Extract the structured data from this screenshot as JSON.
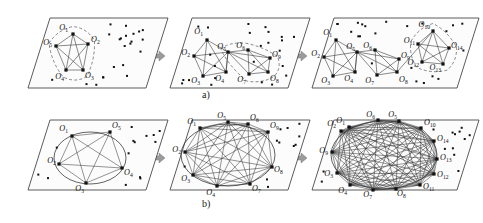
{
  "figure": {
    "type": "diagram",
    "caption_rows": [
      {
        "id": "a",
        "label": "a)",
        "description": "plane-view growth of object cliques with dashed cluster boundaries"
      },
      {
        "id": "b",
        "label": "b)",
        "description": "circular-layout growth of the merged clique graph"
      }
    ],
    "panel_count_per_row": 3,
    "arrow_count_per_row": 2,
    "arrow_color": "#9b9b9b",
    "plane_fill": "#fcfcfc",
    "plane_stroke": "#4a4a4a",
    "node_color": "#111111",
    "edge_color": "#2b2b2b",
    "dashed_boundary_color": "#555555",
    "label_prefix": "O"
  },
  "row_a": {
    "label": "a)",
    "panels": [
      {
        "index": 1,
        "node_labels": [
          "O",
          "O",
          "O",
          "O",
          "O"
        ],
        "node_subscripts": [
          "1",
          "2",
          "3",
          "4",
          "5"
        ],
        "nodes": [
          {
            "label": "O",
            "sub": "1",
            "x": 73,
            "y": 34,
            "lx": 68,
            "ly": 30,
            "anchor": "end"
          },
          {
            "label": "O",
            "sub": "2",
            "x": 88,
            "y": 44,
            "lx": 91,
            "ly": 42,
            "anchor": "start"
          },
          {
            "label": "O",
            "sub": "3",
            "x": 83,
            "y": 70,
            "lx": 85,
            "ly": 78,
            "anchor": "start"
          },
          {
            "label": "O",
            "sub": "4",
            "x": 66,
            "y": 70,
            "lx": 64,
            "ly": 79,
            "anchor": "end"
          },
          {
            "label": "O",
            "sub": "5",
            "x": 56,
            "y": 46,
            "lx": 52,
            "ly": 45,
            "anchor": "end"
          }
        ],
        "clique_edges": "all-pairs",
        "clusters": [
          {
            "members": [
              "O1",
              "O2",
              "O3",
              "O4",
              "O5"
            ],
            "dashed": true
          }
        ],
        "scatter_dot_count": 22
      },
      {
        "index": 2,
        "node_subscripts": [
          "1",
          "2",
          "3",
          "4",
          "5",
          "6",
          "7",
          "8"
        ],
        "nodes": [
          {
            "label": "O",
            "sub": "1",
            "x": 207,
            "y": 40,
            "lx": 203,
            "ly": 34,
            "anchor": "end"
          },
          {
            "label": "O",
            "sub": "2",
            "x": 194,
            "y": 56,
            "lx": 190,
            "ly": 55,
            "anchor": "end"
          },
          {
            "label": "O",
            "sub": "3",
            "x": 203,
            "y": 76,
            "lx": 200,
            "ly": 83,
            "anchor": "end"
          },
          {
            "label": "O",
            "sub": "4",
            "x": 226,
            "y": 72,
            "lx": 224,
            "ly": 81,
            "anchor": "end"
          },
          {
            "label": "O",
            "sub": "5",
            "x": 228,
            "y": 52,
            "lx": 226,
            "ly": 49,
            "anchor": "end"
          },
          {
            "label": "O",
            "sub": "6",
            "x": 248,
            "y": 50,
            "lx": 245,
            "ly": 48,
            "anchor": "end"
          },
          {
            "label": "O",
            "sub": "7",
            "x": 249,
            "y": 74,
            "lx": 246,
            "ly": 82,
            "anchor": "end"
          },
          {
            "label": "O",
            "sub": "8",
            "x": 268,
            "y": 72,
            "lx": 270,
            "ly": 81,
            "anchor": "start"
          },
          {
            "label": "O",
            "sub": "9",
            "x": 270,
            "y": 58,
            "lx": 272,
            "ly": 57,
            "anchor": "start"
          }
        ],
        "clusters": [
          {
            "members": [
              "O1",
              "O2",
              "O3",
              "O4",
              "O5"
            ],
            "dashed": false
          },
          {
            "members": [
              "O5",
              "O6",
              "O7",
              "O8",
              "O9"
            ],
            "dashed": true
          }
        ],
        "scatter_dot_count": 24
      },
      {
        "index": 3,
        "node_subscripts": [
          "1",
          "2",
          "3",
          "4",
          "5",
          "6",
          "7",
          "8",
          "9",
          "10",
          "11",
          "12",
          "13",
          "14"
        ],
        "nodes": [
          {
            "label": "O",
            "sub": "1",
            "x": 336,
            "y": 40,
            "lx": 332,
            "ly": 35,
            "anchor": "end"
          },
          {
            "label": "O",
            "sub": "2",
            "x": 324,
            "y": 57,
            "lx": 320,
            "ly": 56,
            "anchor": "end"
          },
          {
            "label": "O",
            "sub": "3",
            "x": 333,
            "y": 76,
            "lx": 330,
            "ly": 83,
            "anchor": "end"
          },
          {
            "label": "O",
            "sub": "4",
            "x": 355,
            "y": 72,
            "lx": 353,
            "ly": 81,
            "anchor": "end"
          },
          {
            "label": "O",
            "sub": "5",
            "x": 357,
            "y": 52,
            "lx": 355,
            "ly": 49,
            "anchor": "end"
          },
          {
            "label": "O",
            "sub": "6",
            "x": 375,
            "y": 50,
            "lx": 372,
            "ly": 48,
            "anchor": "end"
          },
          {
            "label": "O",
            "sub": "7",
            "x": 377,
            "y": 75,
            "lx": 374,
            "ly": 83,
            "anchor": "end"
          },
          {
            "label": "O",
            "sub": "8",
            "x": 397,
            "y": 72,
            "lx": 399,
            "ly": 82,
            "anchor": "start"
          },
          {
            "label": "O",
            "sub": "9",
            "x": 399,
            "y": 59,
            "lx": 401,
            "ly": 58,
            "anchor": "start"
          },
          {
            "label": "O",
            "sub": "10",
            "x": 433,
            "y": 31,
            "lx": 430,
            "ly": 27,
            "anchor": "end"
          },
          {
            "label": "O",
            "sub": "11",
            "x": 418,
            "y": 44,
            "lx": 415,
            "ly": 43,
            "anchor": "end"
          },
          {
            "label": "O",
            "sub": "12",
            "x": 422,
            "y": 62,
            "lx": 419,
            "ly": 65,
            "anchor": "end"
          },
          {
            "label": "O",
            "sub": "13",
            "x": 443,
            "y": 64,
            "lx": 441,
            "ly": 70,
            "anchor": "end"
          },
          {
            "label": "O",
            "sub": "14",
            "x": 449,
            "y": 48,
            "lx": 451,
            "ly": 48,
            "anchor": "start"
          }
        ],
        "clusters": [
          {
            "members": [
              "O1",
              "O2",
              "O3",
              "O4",
              "O5"
            ],
            "dashed": false
          },
          {
            "members": [
              "O5",
              "O6",
              "O7",
              "O8",
              "O9"
            ],
            "dashed": false
          },
          {
            "members": [
              "O10",
              "O11",
              "O12",
              "O13",
              "O14"
            ],
            "dashed": true
          }
        ],
        "scatter_dot_count": 22
      }
    ]
  },
  "row_b": {
    "label": "b)",
    "panels": [
      {
        "index": 1,
        "node_count": 5,
        "node_subscripts": [
          "1",
          "2",
          "3",
          "4",
          "5"
        ],
        "nodes": [
          {
            "label": "O",
            "sub": "1",
            "x": 72,
            "y": 136,
            "lx": 68,
            "ly": 131,
            "anchor": "end"
          },
          {
            "label": "O",
            "sub": "5",
            "x": 110,
            "y": 132,
            "lx": 112,
            "ly": 128,
            "anchor": "start"
          },
          {
            "label": "O",
            "sub": "4",
            "x": 122,
            "y": 168,
            "lx": 124,
            "ly": 175,
            "anchor": "start"
          },
          {
            "label": "O",
            "sub": "3",
            "x": 86,
            "y": 183,
            "lx": 84,
            "ly": 191,
            "anchor": "end"
          },
          {
            "label": "O",
            "sub": "2",
            "x": 59,
            "y": 164,
            "lx": 56,
            "ly": 163,
            "anchor": "end"
          }
        ],
        "ellipse": {
          "cx": 90,
          "cy": 158,
          "rx": 36,
          "ry": 26
        },
        "scatter_dot_count": 14
      },
      {
        "index": 2,
        "node_count": 9,
        "node_subscripts": [
          "1",
          "2",
          "3",
          "4",
          "5",
          "6",
          "7",
          "8",
          "9"
        ],
        "nodes": [
          {
            "label": "O",
            "sub": "1",
            "x": 200,
            "y": 128,
            "lx": 196,
            "ly": 124,
            "anchor": "end"
          },
          {
            "label": "O",
            "sub": "5",
            "x": 228,
            "y": 122,
            "lx": 226,
            "ly": 118,
            "anchor": "end"
          },
          {
            "label": "O",
            "sub": "6",
            "x": 248,
            "y": 124,
            "lx": 250,
            "ly": 120,
            "anchor": "start"
          },
          {
            "label": "O",
            "sub": "9",
            "x": 268,
            "y": 132,
            "lx": 270,
            "ly": 128,
            "anchor": "start"
          },
          {
            "label": "O",
            "sub": "8",
            "x": 272,
            "y": 167,
            "lx": 274,
            "ly": 172,
            "anchor": "start"
          },
          {
            "label": "O",
            "sub": "7",
            "x": 250,
            "y": 184,
            "lx": 252,
            "ly": 191,
            "anchor": "start"
          },
          {
            "label": "O",
            "sub": "4",
            "x": 217,
            "y": 186,
            "lx": 215,
            "ly": 195,
            "anchor": "end"
          },
          {
            "label": "O",
            "sub": "3",
            "x": 193,
            "y": 175,
            "lx": 190,
            "ly": 181,
            "anchor": "end"
          },
          {
            "label": "O",
            "sub": "2",
            "x": 185,
            "y": 152,
            "lx": 181,
            "ly": 152,
            "anchor": "end"
          }
        ],
        "ellipse": {
          "cx": 228,
          "cy": 155,
          "rx": 47,
          "ry": 31
        },
        "scatter_dot_count": 11
      },
      {
        "index": 3,
        "node_count": 14,
        "node_subscripts": [
          "1",
          "2",
          "3",
          "4",
          "5",
          "6",
          "7",
          "8",
          "9",
          "10",
          "11",
          "12",
          "13",
          "14"
        ],
        "nodes": [
          {
            "label": "O",
            "sub": "1",
            "x": 349,
            "y": 127,
            "lx": 345,
            "ly": 123,
            "anchor": "end"
          },
          {
            "label": "O",
            "sub": "2",
            "x": 341,
            "y": 131,
            "lx": 336,
            "ly": 126,
            "anchor": "end"
          },
          {
            "label": "O",
            "sub": "6",
            "x": 378,
            "y": 120,
            "lx": 375,
            "ly": 117,
            "anchor": "end"
          },
          {
            "label": "O",
            "sub": "5",
            "x": 399,
            "y": 121,
            "lx": 397,
            "ly": 117,
            "anchor": "end"
          },
          {
            "label": "O",
            "sub": "10",
            "x": 421,
            "y": 128,
            "lx": 424,
            "ly": 125,
            "anchor": "start"
          },
          {
            "label": "O",
            "sub": "14",
            "x": 434,
            "y": 141,
            "lx": 437,
            "ly": 141,
            "anchor": "start"
          },
          {
            "label": "O",
            "sub": "13",
            "x": 437,
            "y": 159,
            "lx": 440,
            "ly": 160,
            "anchor": "start"
          },
          {
            "label": "O",
            "sub": "12",
            "x": 434,
            "y": 174,
            "lx": 437,
            "ly": 177,
            "anchor": "start"
          },
          {
            "label": "O",
            "sub": "11",
            "x": 420,
            "y": 185,
            "lx": 423,
            "ly": 189,
            "anchor": "start"
          },
          {
            "label": "O",
            "sub": "8",
            "x": 396,
            "y": 189,
            "lx": 397,
            "ly": 196,
            "anchor": "start"
          },
          {
            "label": "O",
            "sub": "7",
            "x": 373,
            "y": 190,
            "lx": 372,
            "ly": 197,
            "anchor": "end"
          },
          {
            "label": "O",
            "sub": "4",
            "x": 350,
            "y": 185,
            "lx": 347,
            "ly": 193,
            "anchor": "end"
          },
          {
            "label": "O",
            "sub": "3",
            "x": 337,
            "y": 173,
            "lx": 333,
            "ly": 176,
            "anchor": "end"
          },
          {
            "label": "O",
            "sub": "9",
            "x": 332,
            "y": 152,
            "lx": 328,
            "ly": 153,
            "anchor": "end"
          }
        ],
        "ellipse": {
          "cx": 384,
          "cy": 155,
          "rx": 53,
          "ry": 34
        },
        "scatter_dot_count": 13
      }
    ]
  }
}
